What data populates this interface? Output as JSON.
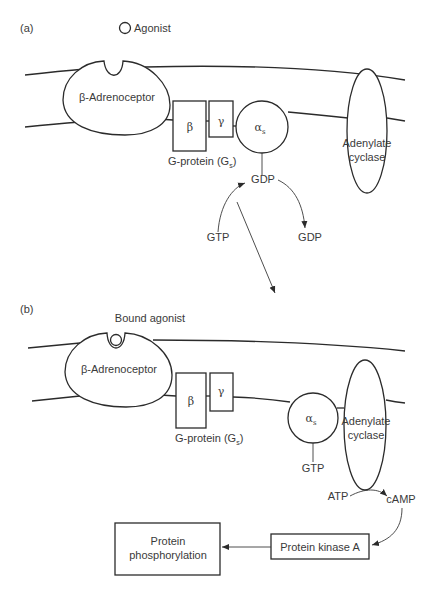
{
  "panel_a": {
    "label": "(a)",
    "agonist": "Agonist",
    "receptor": "β-Adrenoceptor",
    "beta": "β",
    "gamma": "γ",
    "alpha": "α",
    "alpha_sub": "s",
    "g_protein": "G-protein (G",
    "g_protein_sub": "s",
    "g_protein_close": ")",
    "gdp_bound": "GDP",
    "gtp_in": "GTP",
    "gdp_out": "GDP",
    "cyclase_line1": "Adenylate",
    "cyclase_line2": "cyclase"
  },
  "panel_b": {
    "label": "(b)",
    "bound_agonist": "Bound agonist",
    "receptor": "β-Adrenoceptor",
    "beta": "β",
    "gamma": "γ",
    "alpha": "α",
    "alpha_sub": "s",
    "g_protein": "G-protein (G",
    "g_protein_sub": "s",
    "g_protein_close": ")",
    "gtp_bound": "GTP",
    "cyclase_line1": "Adenylate",
    "cyclase_line2": "cyclase",
    "atp": "ATP",
    "camp": "cAMP",
    "kinase": "Protein kinase A",
    "phospho_line1": "Protein",
    "phospho_line2": "phosphorylation"
  },
  "colors": {
    "line": "#2b2b2b",
    "text": "#3a3a3a",
    "background": "#ffffff"
  }
}
